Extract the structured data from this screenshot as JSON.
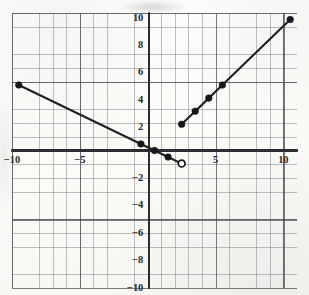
{
  "chart_data": {
    "type": "line",
    "title": "",
    "xlabel": "",
    "ylabel": "",
    "xlim": [
      -10.5,
      10.5
    ],
    "ylim": [
      -10.5,
      10.5
    ],
    "grid": true,
    "minor_grid_step": 1,
    "major_grid_step": 5,
    "legend": "none",
    "xticks": [
      -10,
      -5,
      5,
      10
    ],
    "yticks": [
      10,
      8,
      6,
      4,
      2,
      -2,
      -4,
      -6,
      -8,
      -10
    ],
    "xtick_labels": [
      "−10",
      "−5",
      "5",
      "10"
    ],
    "ytick_labels": [
      "10",
      "8",
      "6",
      "4",
      "2",
      "−2",
      "−4",
      "−6",
      "−8",
      "−10"
    ],
    "series": [
      {
        "name": "left-branch",
        "style": "solid",
        "endpoint_style": "closed-dot",
        "points": [
          {
            "x": -10,
            "y": 5,
            "marker": "closed"
          },
          {
            "x": -1,
            "y": 0.5,
            "marker": "closed"
          },
          {
            "x": 0,
            "y": 0,
            "marker": "closed"
          },
          {
            "x": 1,
            "y": -0.5,
            "marker": "closed"
          },
          {
            "x": 2,
            "y": -1,
            "marker": "open"
          }
        ]
      },
      {
        "name": "right-branch",
        "style": "solid",
        "endpoint_style": "closed-dot",
        "points": [
          {
            "x": 2,
            "y": 2,
            "marker": "closed"
          },
          {
            "x": 3,
            "y": 3,
            "marker": "closed"
          },
          {
            "x": 4,
            "y": 4,
            "marker": "closed"
          },
          {
            "x": 5,
            "y": 5,
            "marker": "closed"
          },
          {
            "x": 10,
            "y": 10,
            "marker": "closed"
          }
        ]
      }
    ],
    "annotations": []
  },
  "colors": {
    "curve": "#1e2026",
    "axis": "#2b2d33",
    "major_grid": "#464a52",
    "minor_grid": "#808490",
    "paper": "#fbfbf8",
    "tick_text": "#26282e"
  }
}
